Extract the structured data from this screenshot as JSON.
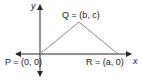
{
  "diagram": {
    "type": "coordinate-plane-triangle",
    "axes": {
      "x_label": "x",
      "y_label": "y"
    },
    "points": [
      {
        "name": "P",
        "label": "P = (0, 0)",
        "coords": "(0, 0)"
      },
      {
        "name": "Q",
        "label": "Q = (b, c)",
        "coords": "(b, c)"
      },
      {
        "name": "R",
        "label": "R = (a, 0)",
        "coords": "(a, 0)"
      }
    ],
    "colors": {
      "axis": "#2b2b2b",
      "triangle": "#8a8a8a",
      "text": "#1a1a1a"
    }
  }
}
